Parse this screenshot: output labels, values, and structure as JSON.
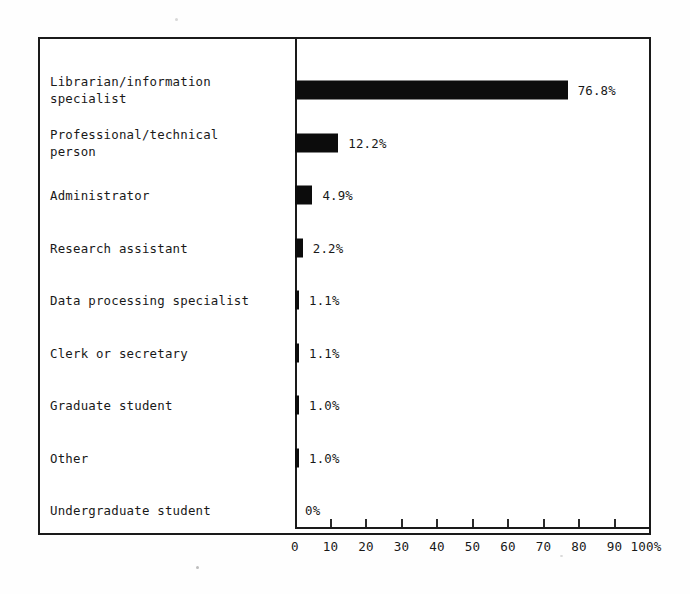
{
  "chart_data": {
    "type": "bar",
    "orientation": "horizontal",
    "title": "",
    "xlabel": "",
    "ylabel": "",
    "xlim": [
      0,
      100
    ],
    "grid": false,
    "legend": null,
    "axis_unit": "%",
    "categories": [
      "Librarian/information\nspecialist",
      "Professional/technical\nperson",
      "Administrator",
      "Research assistant",
      "Data processing specialist",
      "Clerk or secretary",
      "Graduate student",
      "Other",
      "Undergraduate student"
    ],
    "values": [
      76.8,
      12.2,
      4.9,
      2.2,
      1.1,
      1.1,
      1.0,
      1.0,
      0
    ],
    "value_labels": [
      "76.8%",
      "12.2%",
      "4.9%",
      "2.2%",
      "1.1%",
      "1.1%",
      "1.0%",
      "1.0%",
      "0%"
    ],
    "xticks": [
      0,
      10,
      20,
      30,
      40,
      50,
      60,
      70,
      80,
      90,
      100
    ],
    "xtick_labels": [
      "0",
      "10",
      "20",
      "30",
      "40",
      "50",
      "60",
      "70",
      "80",
      "90",
      "100%"
    ]
  },
  "colors": {
    "bar": "#0c0c0c",
    "axis": "#1a1a1a",
    "text": "#191919",
    "background": "#ffffff"
  }
}
